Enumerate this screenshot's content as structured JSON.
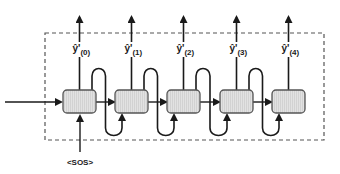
{
  "diagram": {
    "start_token": "<SOS>",
    "output_label_base": "ŷ'",
    "cells": [
      {
        "index": 0,
        "x": 63,
        "label": "ŷ'",
        "sub": "(0)"
      },
      {
        "index": 1,
        "x": 115,
        "label": "ŷ'",
        "sub": "(1)"
      },
      {
        "index": 2,
        "x": 167,
        "label": "ŷ'",
        "sub": "(2)"
      },
      {
        "index": 3,
        "x": 220,
        "label": "ŷ'",
        "sub": "(3)"
      },
      {
        "index": 4,
        "x": 272,
        "label": "ŷ'",
        "sub": "(4)"
      }
    ],
    "colors": {
      "line": "#1a1a1a",
      "cell_fill": "#dcdcdc",
      "cell_stroke": "#555555",
      "dashed_box": "#555555"
    }
  }
}
